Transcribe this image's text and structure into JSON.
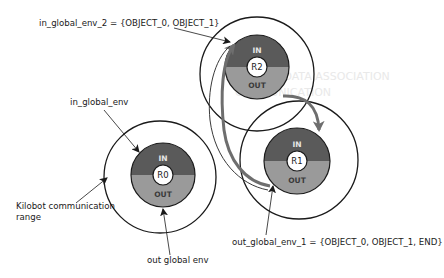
{
  "colors": {
    "in_half": "#5a5a5a",
    "out_half": "#9a9a9a",
    "outline": "#1a1a1a",
    "flow_arrow": "#6e6e6e",
    "background": "#ffffff"
  },
  "robots": [
    {
      "id": "R0",
      "in_label": "IN",
      "out_label": "OUT"
    },
    {
      "id": "R1",
      "in_label": "IN",
      "out_label": "OUT"
    },
    {
      "id": "R2",
      "in_label": "IN",
      "out_label": "OUT"
    }
  ],
  "annotations": {
    "in_global_env_2": "in_global_env_2 = {OBJECT_0, OBJECT_1}",
    "in_global_env": "in_global_env",
    "comm_range_line1": "Kilobot communication",
    "comm_range_line2": "range",
    "out_global_env": "out global env",
    "out_global_env_1": "out_global_env_1 = {OBJECT_0, OBJECT_1, END}"
  },
  "background_ghost_text": {
    "line1": "SEPARATE DATA ASSOCIATION",
    "line2": "COMMUNICATION"
  }
}
